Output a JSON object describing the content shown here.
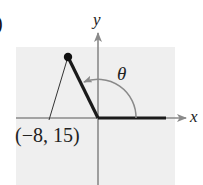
{
  "figure": {
    "part_label": ")",
    "axes": {
      "x_label": "x",
      "y_label": "y"
    },
    "angle": {
      "symbol": "θ",
      "direction": "counterclockwise"
    },
    "point": {
      "label": "(−8, 15)",
      "x": -8,
      "y": 15
    },
    "colors": {
      "background_panel": "#efefef",
      "axis": "#8a8a8a",
      "terminal_side": "#1a1a1a",
      "arc": "#8a8a8a"
    }
  }
}
